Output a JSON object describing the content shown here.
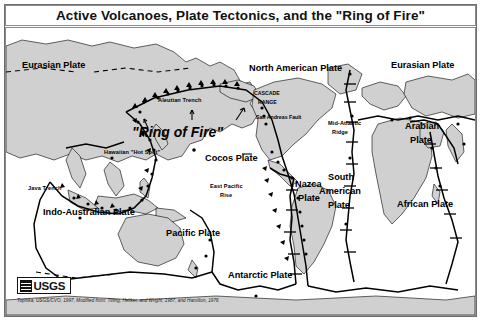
{
  "figure": {
    "title": "Active Volcanoes, Plate Tectonics, and the \"Ring of Fire\"",
    "credit": "Topinka, USGS/CVO, 1997, Modified from: Tilling, Heliker, and Wright, 1987, and Hamilton, 1976",
    "logo": {
      "agency": "USGS",
      "icon": "usgs-wave-logo"
    }
  },
  "map": {
    "ocean_color": "#ffffff",
    "land_color": "#d0d0d0",
    "line_color": "#000000",
    "volcano_color": "#000000",
    "plates": [
      {
        "id": "eurasian-west",
        "label": "Eurasian Plate"
      },
      {
        "id": "eurasian-east",
        "label": "Eurasian Plate"
      },
      {
        "id": "north-american",
        "label": "North American Plate"
      },
      {
        "id": "cocos",
        "label": "Cocos Plate"
      },
      {
        "id": "nazca",
        "label": "Nazca\nPlate"
      },
      {
        "id": "south-american",
        "label": "South\nAmerican\nPlate"
      },
      {
        "id": "african",
        "label": "African Plate"
      },
      {
        "id": "arabian",
        "label": "Arabian\nPlate"
      },
      {
        "id": "indo-australian",
        "label": "Indo-Australian Plate"
      },
      {
        "id": "pacific",
        "label": "Pacific Plate"
      },
      {
        "id": "antarctic",
        "label": "Antarctic Plate"
      }
    ],
    "plate_labels": {
      "eurasian_west": "Eurasian Plate",
      "eurasian_east": "Eurasian Plate",
      "north_american": "North American Plate",
      "cocos": "Cocos Plate",
      "nazca_l1": "Nazca",
      "nazca_l2": "Plate",
      "south_american_l1": "South",
      "south_american_l2": "American",
      "south_american_l3": "Plate",
      "african": "African Plate",
      "arabian_l1": "Arabian",
      "arabian_l2": "Plate",
      "indo_australian": "Indo-Australian Plate",
      "pacific": "Pacific Plate",
      "antarctic": "Antarctic Plate"
    },
    "features": {
      "ring_of_fire": "\"Ring of Fire\"",
      "aleutian_trench": "Aleutian Trench",
      "hawaiian_hot_spot": "Hawaiian \"Hot Spot\"",
      "cascade_range_l1": "CASCADE",
      "cascade_range_l2": "RANGE",
      "san_andreas_fault": "San Andreas Fault",
      "mid_atlantic_ridge_l1": "Mid-Atlantic",
      "mid_atlantic_ridge_l2": "Ridge",
      "east_pacific_rise_l1": "East Pacific",
      "east_pacific_rise_l2": "Rise",
      "java_trench": "Java Trench"
    }
  }
}
